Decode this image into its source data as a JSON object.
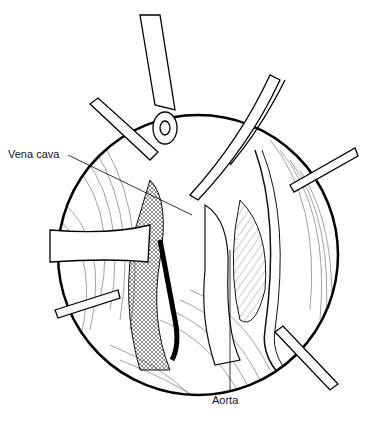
{
  "figure": {
    "type": "surgical-illustration",
    "view": "circular-operative-field",
    "labels": [
      {
        "id": "vena-cava",
        "text": "Vena cava",
        "position": "left"
      },
      {
        "id": "aorta",
        "text": "Aorta",
        "position": "bottom"
      }
    ],
    "instruments": [
      "retractor-top",
      "retractor-upper-left",
      "retractor-left",
      "retractor-lower-left",
      "retractor-upper-right",
      "retractor-right",
      "retractor-lower-right",
      "forceps-top"
    ],
    "colors": {
      "line": "#111111",
      "background": "#ffffff"
    }
  }
}
